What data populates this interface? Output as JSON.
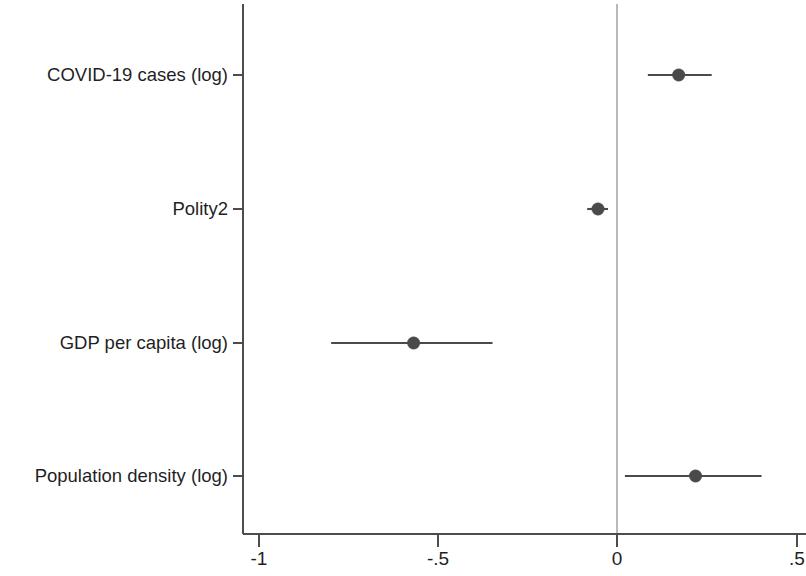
{
  "chart_data": {
    "type": "scatter",
    "subtype": "coefficient-plot-forest",
    "title": "",
    "subtitle": "",
    "xlabel": "",
    "ylabel": "",
    "xlim": [
      -1.1,
      0.53
    ],
    "xticks": [
      -1,
      -0.5,
      0,
      0.5
    ],
    "xticklabels": [
      "-1",
      "-.5",
      "0",
      ".5"
    ],
    "grid": false,
    "legend": null,
    "reference_line": {
      "value": 0,
      "color": "#b9b9b9",
      "orientation": "vertical"
    },
    "categories": [
      "COVID-19 cases (log)",
      "Polity2",
      "GDP per capita (log)",
      "Population density (log)"
    ],
    "series": [
      {
        "name": "Coefficient estimate",
        "marker_color": "#4a4a4a",
        "line_color": "#4a4a4a",
        "points": [
          {
            "category": "COVID-19 cases (log)",
            "estimate": 0.172,
            "ci_low": 0.086,
            "ci_high": 0.264
          },
          {
            "category": "Polity2",
            "estimate": -0.053,
            "ci_low": -0.083,
            "ci_high": -0.025
          },
          {
            "category": "GDP per capita (log)",
            "estimate": -0.567,
            "ci_low": -0.797,
            "ci_high": -0.347
          },
          {
            "category": "Population density (log)",
            "estimate": 0.219,
            "ci_low": 0.022,
            "ci_high": 0.403
          }
        ]
      }
    ]
  },
  "axis": {
    "x_tick_0": "-1",
    "x_tick_1": "-.5",
    "x_tick_2": "0",
    "x_tick_3": ".5"
  },
  "labels": {
    "cat_0": "COVID-19 cases (log)",
    "cat_1": "Polity2",
    "cat_2": "GDP per capita (log)",
    "cat_3": "Population density (log)"
  }
}
